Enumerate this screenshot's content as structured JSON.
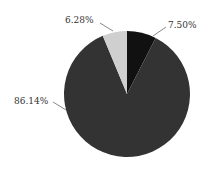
{
  "chart_data": {
    "type": "pie",
    "title": "",
    "slices": [
      {
        "label": "7.50%",
        "value": 7.5,
        "color": "#111111"
      },
      {
        "label": "86.14%",
        "value": 86.14,
        "color": "#333333"
      },
      {
        "label": "6.28%",
        "value": 6.28,
        "color": "#cfcfcf"
      }
    ],
    "start_angle": "12 o'clock",
    "direction": "clockwise",
    "legend": "none"
  },
  "labels": {
    "slice1": "7.50%",
    "slice2": "86.14%",
    "slice3": "6.28%"
  }
}
